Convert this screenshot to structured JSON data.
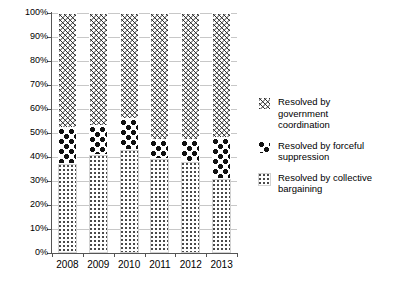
{
  "chart_data": {
    "type": "bar",
    "subtype": "stacked-100-percent",
    "title": "",
    "xlabel": "",
    "ylabel": "",
    "categories": [
      "2008",
      "2009",
      "2010",
      "2011",
      "2012",
      "2013"
    ],
    "ylim": [
      0,
      100
    ],
    "y_ticks": [
      0,
      10,
      20,
      30,
      40,
      50,
      60,
      70,
      80,
      90,
      100
    ],
    "y_tick_labels": [
      "0%",
      "10%",
      "20%",
      "30%",
      "40%",
      "50%",
      "60%",
      "70%",
      "80%",
      "90%",
      "100%"
    ],
    "grid": true,
    "legend_position": "right",
    "series": [
      {
        "name": "Resolved by collective bargaining",
        "pattern": "light-dots",
        "values": [
          37,
          41,
          43,
          39,
          38,
          31
        ]
      },
      {
        "name": "Resolved by forceful suppression",
        "pattern": "dark-blocks",
        "values": [
          15,
          12,
          13,
          8,
          9,
          17
        ]
      },
      {
        "name": "Resolved by government coordination",
        "pattern": "zigzag-waves",
        "values": [
          48,
          47,
          44,
          53,
          53,
          52
        ]
      }
    ],
    "segment_tops": {
      "collective_bargaining": [
        37,
        41,
        43,
        39,
        38,
        31
      ],
      "forceful_suppression": [
        52,
        53,
        56,
        47,
        47,
        48
      ],
      "government_coordination": [
        100,
        100,
        100,
        100,
        100,
        100
      ]
    }
  },
  "legend": {
    "items": [
      {
        "label": "Resolved by\ngovernment\ncoordination",
        "swatch": "zigzag-waves-swatch"
      },
      {
        "label": "Resolved by forceful\nsuppression",
        "swatch": "dark-blocks-swatch"
      },
      {
        "label": "Resolved by collective\nbargaining",
        "swatch": "light-dots-swatch"
      }
    ]
  }
}
